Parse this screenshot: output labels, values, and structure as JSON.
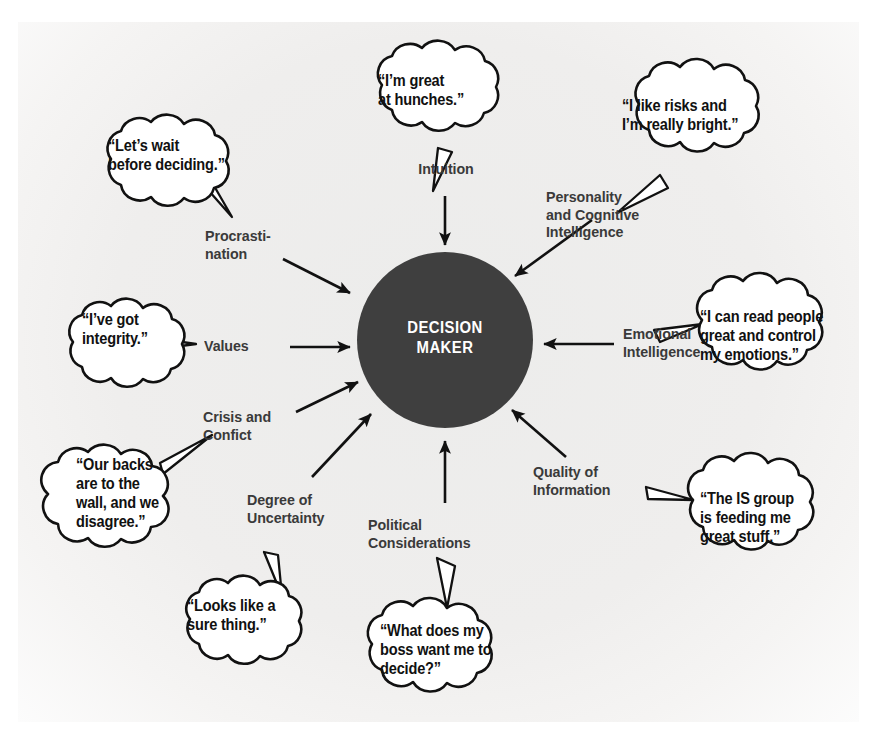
{
  "figure": {
    "center_label": "DECISION\nMAKER",
    "colors": {
      "center_fill": "#3f3f3f",
      "center_text": "#ffffff",
      "label_text": "#3a3a3a",
      "bubble_text": "#111111",
      "bubble_fill": "#ffffff",
      "stroke": "#111111",
      "background": "#efeeed"
    }
  },
  "nodes": [
    {
      "id": "intuition",
      "label": "Intuition",
      "quote": "“I’m great\nat hunches.”",
      "position": "top"
    },
    {
      "id": "personality-cognitive-intelligence",
      "label": "Personality\nand Cognitive\nIntelligence",
      "quote": "“I like risks and\nI’m really bright.”",
      "position": "top-right"
    },
    {
      "id": "emotional-intelligence",
      "label": "Emotional\nIntelligence",
      "quote": "“I can read people\ngreat and control\nmy emotions.”",
      "position": "right"
    },
    {
      "id": "quality-of-information",
      "label": "Quality of\nInformation",
      "quote": "“The IS group\nis feeding me\ngreat stuff.”",
      "position": "bottom-right"
    },
    {
      "id": "political-considerations",
      "label": "Political\nConsiderations",
      "quote": "“What does my\nboss want me to\ndecide?”",
      "position": "bottom"
    },
    {
      "id": "degree-of-uncertainty",
      "label": "Degree of\nUncertainty",
      "quote": "“Looks like a\nsure thing.”",
      "position": "bottom-left"
    },
    {
      "id": "crisis-and-confict",
      "label": "Crisis and\nConfict",
      "quote": "“Our backs\nare to the\nwall, and we\ndisagree.”",
      "position": "left-lower"
    },
    {
      "id": "values",
      "label": "Values",
      "quote": "“I’ve got\nintegrity.”",
      "position": "left"
    },
    {
      "id": "procrastination",
      "label": "Procrasti-\nnation",
      "quote": "“Let’s wait\nbefore deciding.”",
      "position": "top-left"
    }
  ]
}
